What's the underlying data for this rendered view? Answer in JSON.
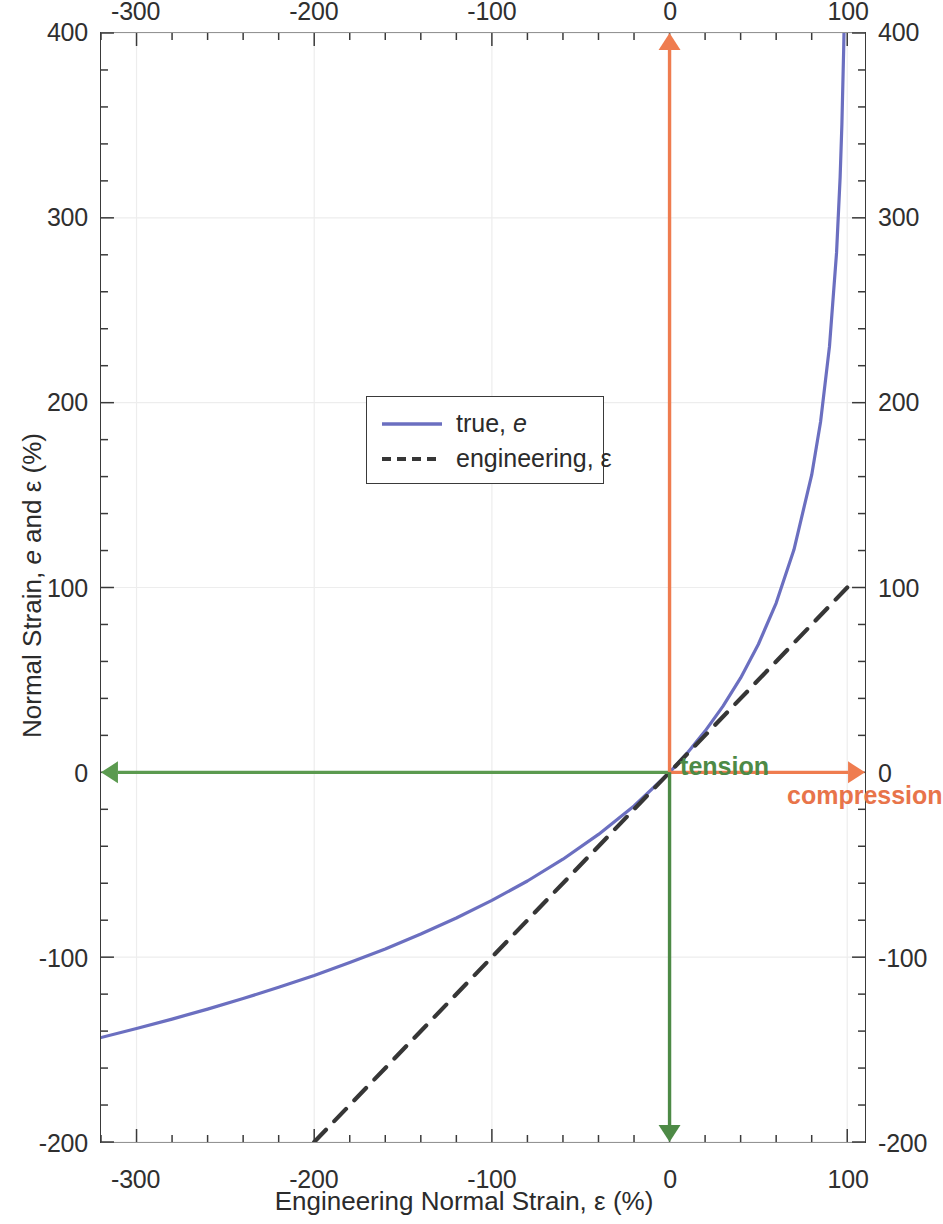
{
  "chart_data": {
    "type": "line",
    "title": "",
    "xlabel": "Engineering Normal Strain, ε (%)",
    "ylabel": "Normal Strain, e and ε (%)",
    "xlim": [
      -320,
      110
    ],
    "ylim": [
      -200,
      400
    ],
    "x_ticks": [
      -300,
      -200,
      -100,
      0,
      100
    ],
    "y_ticks": [
      -200,
      -100,
      0,
      100,
      200,
      300,
      400
    ],
    "x_tick_labels": [
      "-300",
      "-200",
      "-100",
      "0",
      "100"
    ],
    "y_tick_labels": [
      "-200",
      "-100",
      "0",
      "100",
      "200",
      "300",
      "400"
    ],
    "x_minor_step": 20,
    "y_minor_step": 20,
    "grid": true,
    "grid_color": "#ededed",
    "axis_mirror_top": true,
    "axis_mirror_right": true,
    "legend_position": "upper-left-inset",
    "series": [
      {
        "name": "true, e",
        "legend_label_plain": "true, e",
        "style": "solid",
        "color": "#6b6fc0",
        "formula": "e = -ln(1 - ε/100) × 100",
        "points": [
          [
            -320,
            -143.5
          ],
          [
            -300,
            -138.6
          ],
          [
            -280,
            -133.5
          ],
          [
            -260,
            -128.1
          ],
          [
            -240,
            -122.4
          ],
          [
            -220,
            -116.3
          ],
          [
            -200,
            -109.9
          ],
          [
            -180,
            -102.9
          ],
          [
            -160,
            -95.6
          ],
          [
            -140,
            -87.5
          ],
          [
            -120,
            -78.8
          ],
          [
            -100,
            -69.3
          ],
          [
            -80,
            -58.8
          ],
          [
            -60,
            -47.0
          ],
          [
            -40,
            -33.6
          ],
          [
            -20,
            -18.2
          ],
          [
            0,
            0
          ],
          [
            10,
            10.5
          ],
          [
            20,
            22.3
          ],
          [
            30,
            35.7
          ],
          [
            40,
            51.1
          ],
          [
            50,
            69.3
          ],
          [
            60,
            91.6
          ],
          [
            70,
            120.4
          ],
          [
            80,
            160.9
          ],
          [
            85,
            189.7
          ],
          [
            90,
            230.3
          ],
          [
            94,
            281.3
          ],
          [
            96,
            321.9
          ],
          [
            97,
            350.7
          ],
          [
            98,
            391.2
          ],
          [
            98.2,
            401.4
          ]
        ]
      },
      {
        "name": "engineering, ε",
        "legend_label_plain": "engineering, ε",
        "style": "dashed",
        "color": "#363636",
        "formula": "ε = ε",
        "points": [
          [
            -200,
            -200
          ],
          [
            100,
            100
          ]
        ]
      }
    ],
    "annotations": [
      {
        "text": "tension",
        "color": "#4d8a46",
        "x": -10,
        "y": 13,
        "align": "right",
        "bold": true
      },
      {
        "text": "compression",
        "color": "#e8744a",
        "x": 3,
        "y": 13,
        "align": "left",
        "bold": true
      }
    ],
    "arrows": [
      {
        "name": "tension-horizontal-arrow",
        "color": "#5b9a4f",
        "from": [
          0,
          0
        ],
        "to": [
          -320,
          0
        ],
        "direction": "left"
      },
      {
        "name": "compression-horizontal-arrow",
        "color": "#ef7c4f",
        "from": [
          0,
          0
        ],
        "to": [
          110,
          0
        ],
        "direction": "right"
      },
      {
        "name": "compression-vertical-arrow",
        "color": "#ef7c4f",
        "from": [
          0,
          0
        ],
        "to": [
          0,
          400
        ],
        "direction": "up"
      },
      {
        "name": "tension-vertical-arrow",
        "color": "#4d8a46",
        "from": [
          0,
          0
        ],
        "to": [
          0,
          -200
        ],
        "direction": "down"
      }
    ]
  },
  "axis_titles": {
    "x_prefix": "Engineering Normal Strain, ",
    "x_symbol": "ε",
    "x_suffix": " (%)",
    "y_prefix": "Normal Strain, ",
    "y_italic": "e",
    "y_mid": " and ",
    "y_symbol": "ε",
    "y_suffix": " (%)"
  },
  "legend": {
    "items": [
      {
        "prefix": "true, ",
        "italic": "e",
        "suffix": "",
        "style": "solid",
        "color": "#6b6fc0"
      },
      {
        "prefix": "engineering, ",
        "italic": "",
        "suffix": "ε",
        "style": "dashed",
        "color": "#363636"
      }
    ]
  },
  "annotations": {
    "tension": "tension",
    "compression": "compression",
    "tension_color": "#4d8a46",
    "compression_color": "#e8744a"
  },
  "colors": {
    "true_curve": "#6b6fc0",
    "engineering_curve": "#363636",
    "green_arrow": "#5b9a4f",
    "orange_arrow": "#ef7c4f",
    "axis": "#3a3a3a",
    "grid": "#ededed",
    "text": "#2b2b2b"
  }
}
